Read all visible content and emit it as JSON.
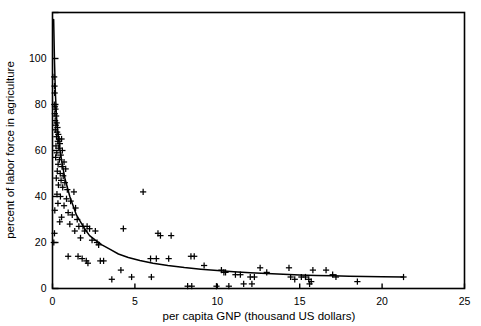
{
  "chart_data": {
    "type": "scatter",
    "title": "",
    "xlabel": "per capita GNP (thousand US dollars)",
    "ylabel": "percent of labor force in agriculture",
    "xlim": [
      0,
      25
    ],
    "ylim": [
      0,
      120
    ],
    "xticks": [
      0,
      5,
      10,
      15,
      20,
      25
    ],
    "xtick_labels": [
      "0",
      "5",
      "10",
      "15",
      "20",
      "25"
    ],
    "yticks": [
      0,
      20,
      40,
      60,
      80,
      100,
      120
    ],
    "ytick_labels": [
      "0",
      "20",
      "40",
      "60",
      "80",
      "100",
      ""
    ],
    "grid": false,
    "legend": null,
    "marker": "plus",
    "marker_color": "#000000",
    "line_color": "#000000",
    "frame": true,
    "points": [
      [
        0.1,
        92
      ],
      [
        0.12,
        88
      ],
      [
        0.13,
        85
      ],
      [
        0.11,
        80
      ],
      [
        0.15,
        79
      ],
      [
        0.18,
        78
      ],
      [
        0.14,
        76
      ],
      [
        0.22,
        75
      ],
      [
        0.16,
        73
      ],
      [
        0.25,
        72
      ],
      [
        0.2,
        71
      ],
      [
        0.3,
        70
      ],
      [
        0.17,
        69
      ],
      [
        0.28,
        68
      ],
      [
        0.35,
        67
      ],
      [
        0.24,
        66
      ],
      [
        0.4,
        65
      ],
      [
        0.55,
        65
      ],
      [
        0.32,
        64
      ],
      [
        0.45,
        63
      ],
      [
        0.21,
        62
      ],
      [
        0.38,
        61
      ],
      [
        0.6,
        60
      ],
      [
        0.26,
        59
      ],
      [
        0.5,
        58
      ],
      [
        0.19,
        57
      ],
      [
        0.42,
        56
      ],
      [
        0.7,
        55
      ],
      [
        0.34,
        54
      ],
      [
        0.58,
        53
      ],
      [
        0.8,
        52
      ],
      [
        0.29,
        51
      ],
      [
        0.47,
        50
      ],
      [
        0.65,
        49
      ],
      [
        0.23,
        48
      ],
      [
        0.52,
        47
      ],
      [
        0.75,
        46
      ],
      [
        0.36,
        45
      ],
      [
        0.62,
        44
      ],
      [
        0.9,
        43
      ],
      [
        1.3,
        42
      ],
      [
        0.27,
        41
      ],
      [
        0.48,
        40
      ],
      [
        0.85,
        39
      ],
      [
        1.1,
        38
      ],
      [
        0.33,
        37
      ],
      [
        0.7,
        36
      ],
      [
        1.4,
        35
      ],
      [
        0.14,
        34
      ],
      [
        0.95,
        33
      ],
      [
        1.2,
        32
      ],
      [
        0.55,
        31
      ],
      [
        1.5,
        30
      ],
      [
        0.44,
        29
      ],
      [
        1.05,
        28
      ],
      [
        1.6,
        27
      ],
      [
        1.85,
        27
      ],
      [
        2.1,
        27
      ],
      [
        2.25,
        26
      ],
      [
        0.12,
        24
      ],
      [
        1.35,
        25
      ],
      [
        1.95,
        25
      ],
      [
        2.6,
        25
      ],
      [
        4.3,
        26
      ],
      [
        0.08,
        20
      ],
      [
        1.7,
        22
      ],
      [
        2.4,
        21
      ],
      [
        2.7,
        20
      ],
      [
        2.8,
        19
      ],
      [
        6.4,
        24
      ],
      [
        6.55,
        23
      ],
      [
        7.2,
        23
      ],
      [
        5.5,
        42
      ],
      [
        0.95,
        14
      ],
      [
        1.55,
        14
      ],
      [
        1.8,
        13
      ],
      [
        2.05,
        12
      ],
      [
        2.15,
        11
      ],
      [
        2.9,
        12
      ],
      [
        3.1,
        12
      ],
      [
        4.15,
        8
      ],
      [
        5.95,
        13
      ],
      [
        6.3,
        13
      ],
      [
        7.05,
        13
      ],
      [
        8.4,
        14
      ],
      [
        8.6,
        14
      ],
      [
        9.2,
        10
      ],
      [
        10.25,
        8
      ],
      [
        10.4,
        7
      ],
      [
        10.5,
        7
      ],
      [
        11.1,
        6
      ],
      [
        11.4,
        6
      ],
      [
        12.0,
        5
      ],
      [
        12.25,
        5
      ],
      [
        12.6,
        9
      ],
      [
        13.0,
        7
      ],
      [
        14.35,
        9
      ],
      [
        14.45,
        5
      ],
      [
        14.7,
        4
      ],
      [
        15.1,
        5
      ],
      [
        15.35,
        5
      ],
      [
        15.55,
        4
      ],
      [
        15.7,
        3
      ],
      [
        15.8,
        8
      ],
      [
        16.6,
        8
      ],
      [
        17.0,
        6
      ],
      [
        17.2,
        5
      ],
      [
        18.5,
        3
      ],
      [
        21.3,
        5
      ],
      [
        4.8,
        5
      ],
      [
        8.2,
        1
      ],
      [
        8.45,
        1
      ],
      [
        9.95,
        1
      ],
      [
        10.7,
        1
      ],
      [
        11.6,
        2
      ],
      [
        12.1,
        2
      ],
      [
        15.6,
        2
      ],
      [
        3.6,
        4
      ],
      [
        6.0,
        5
      ]
    ],
    "fit_curve": {
      "description": "fitted decay curve",
      "points": [
        [
          0.07,
          117
        ],
        [
          0.12,
          99
        ],
        [
          0.18,
          84
        ],
        [
          0.25,
          74
        ],
        [
          0.32,
          68
        ],
        [
          0.4,
          63
        ],
        [
          0.5,
          58
        ],
        [
          0.62,
          53
        ],
        [
          0.75,
          48
        ],
        [
          0.9,
          44
        ],
        [
          1.05,
          40
        ],
        [
          1.25,
          36
        ],
        [
          1.45,
          32
        ],
        [
          1.7,
          29
        ],
        [
          1.95,
          26
        ],
        [
          2.25,
          23
        ],
        [
          2.6,
          21
        ],
        [
          3.0,
          19
        ],
        [
          3.5,
          17
        ],
        [
          4.0,
          15
        ],
        [
          4.6,
          13.5
        ],
        [
          5.3,
          12.2
        ],
        [
          6.1,
          11.0
        ],
        [
          7.0,
          10.0
        ],
        [
          8.0,
          9.1
        ],
        [
          9.0,
          8.4
        ],
        [
          10.0,
          7.8
        ],
        [
          11.0,
          7.3
        ],
        [
          12.0,
          6.9
        ],
        [
          13.0,
          6.5
        ],
        [
          14.0,
          6.2
        ],
        [
          15.0,
          5.9
        ],
        [
          16.0,
          5.7
        ],
        [
          17.0,
          5.5
        ],
        [
          18.0,
          5.3
        ],
        [
          19.0,
          5.2
        ],
        [
          20.0,
          5.1
        ],
        [
          21.3,
          5.0
        ]
      ]
    }
  }
}
